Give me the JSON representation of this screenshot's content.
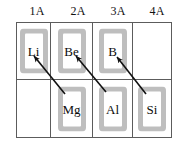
{
  "figure": {
    "background_color": "#ffffff",
    "grid_line_color": "#5c5c5c",
    "box_hatch_color": "#8a8a8a"
  },
  "headers": {
    "columns": [
      {
        "label": "1A"
      },
      {
        "label": "2A"
      },
      {
        "label": "3A"
      },
      {
        "label": "4A"
      }
    ]
  },
  "grid": {
    "rows": [
      {
        "cells": [
          {
            "symbol": "Li",
            "empty": false
          },
          {
            "symbol": "Be",
            "empty": false
          },
          {
            "symbol": "B",
            "empty": false
          },
          {
            "symbol": "",
            "empty": true
          }
        ]
      },
      {
        "cells": [
          {
            "symbol": "",
            "empty": true
          },
          {
            "symbol": "Mg",
            "empty": false
          },
          {
            "symbol": "Al",
            "empty": false
          },
          {
            "symbol": "Si",
            "empty": false
          }
        ]
      }
    ]
  },
  "arrows": [
    {
      "from": "Mg",
      "to": "Li",
      "color": "#111111"
    },
    {
      "from": "Al",
      "to": "Be",
      "color": "#111111"
    },
    {
      "from": "Si",
      "to": "B",
      "color": "#111111"
    }
  ]
}
